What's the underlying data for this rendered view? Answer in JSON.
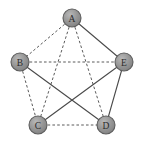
{
  "figure": {
    "width": 144,
    "height": 148,
    "background_color": "#ffffff"
  },
  "style": {
    "node_fill_color": "#8f8f8f",
    "node_fill_highlight": "#b4b4b4",
    "node_stroke_color": "#5d5d5d",
    "node_radius": 9,
    "node_label_color": "#2b2b2b",
    "edge_solid_color": "#4a4a4a",
    "edge_dashed_color": "#5a5a5a"
  },
  "chart_data": {
    "type": "diagram",
    "diagram_type": "node-link-graph",
    "title": "",
    "nodes": [
      {
        "id": "A",
        "label": "A",
        "x": 72,
        "y": 18
      },
      {
        "id": "B",
        "label": "B",
        "x": 20,
        "y": 62
      },
      {
        "id": "E",
        "label": "E",
        "x": 124,
        "y": 62
      },
      {
        "id": "C",
        "label": "C",
        "x": 38,
        "y": 125
      },
      {
        "id": "D",
        "label": "D",
        "x": 106,
        "y": 125
      }
    ],
    "edges": [
      {
        "source": "A",
        "target": "B",
        "style": "dashed"
      },
      {
        "source": "A",
        "target": "E",
        "style": "solid"
      },
      {
        "source": "A",
        "target": "C",
        "style": "dashed"
      },
      {
        "source": "A",
        "target": "D",
        "style": "dashed"
      },
      {
        "source": "B",
        "target": "E",
        "style": "dashed"
      },
      {
        "source": "B",
        "target": "C",
        "style": "dashed"
      },
      {
        "source": "B",
        "target": "D",
        "style": "solid"
      },
      {
        "source": "C",
        "target": "D",
        "style": "dashed"
      },
      {
        "source": "C",
        "target": "E",
        "style": "solid"
      },
      {
        "source": "D",
        "target": "E",
        "style": "solid"
      }
    ],
    "node_count": 5,
    "edge_count": 10,
    "solid_edge_count": 4,
    "dashed_edge_count": 6,
    "legend": [],
    "annotations": []
  }
}
